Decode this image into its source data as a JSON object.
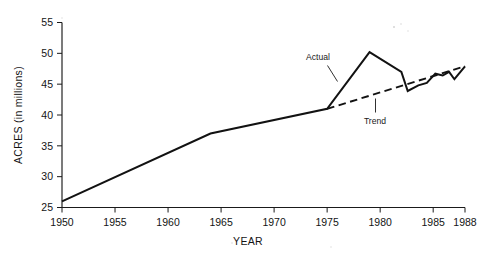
{
  "chart_data": {
    "type": "line",
    "title": "",
    "subtitle": "",
    "xlabel": "YEAR",
    "ylabel": "ACRES (in millions)",
    "xlim": [
      1950,
      1988
    ],
    "ylim": [
      25,
      55
    ],
    "grid": false,
    "legend_position": "inline-annotations",
    "x_ticks": [
      1950,
      1955,
      1960,
      1965,
      1970,
      1975,
      1980,
      1985,
      1988
    ],
    "x_tick_labels": [
      "1950",
      "1955",
      "1960",
      "1965",
      "1970",
      "1975",
      "1980",
      "1985",
      "1988"
    ],
    "y_ticks": [
      25,
      30,
      35,
      40,
      45,
      50,
      55
    ],
    "y_tick_labels": [
      "25",
      "30",
      "35",
      "40",
      "45",
      "50",
      "55"
    ],
    "annotations": [
      {
        "text": "Actual",
        "x": 1974.0,
        "y": 49.2
      },
      {
        "text": "Trend",
        "x": 1979.3,
        "y": 38.4
      }
    ],
    "series": [
      {
        "name": "Actual",
        "style": "solid",
        "color": "#121212",
        "points": [
          {
            "x": 1950,
            "y": 26.0
          },
          {
            "x": 1964,
            "y": 37.0
          },
          {
            "x": 1975,
            "y": 41.0
          },
          {
            "x": 1979,
            "y": 50.2
          },
          {
            "x": 1982,
            "y": 47.0
          },
          {
            "x": 1982.6,
            "y": 43.9
          },
          {
            "x": 1983.6,
            "y": 44.8
          },
          {
            "x": 1984.4,
            "y": 45.2
          },
          {
            "x": 1985.2,
            "y": 46.7
          },
          {
            "x": 1985.9,
            "y": 46.4
          },
          {
            "x": 1986.5,
            "y": 47.0
          },
          {
            "x": 1987.0,
            "y": 45.8
          },
          {
            "x": 1988.0,
            "y": 47.9
          }
        ]
      },
      {
        "name": "Trend",
        "style": "dashed",
        "color": "#121212",
        "points": [
          {
            "x": 1975,
            "y": 41.0
          },
          {
            "x": 1988,
            "y": 47.9
          }
        ]
      }
    ]
  }
}
